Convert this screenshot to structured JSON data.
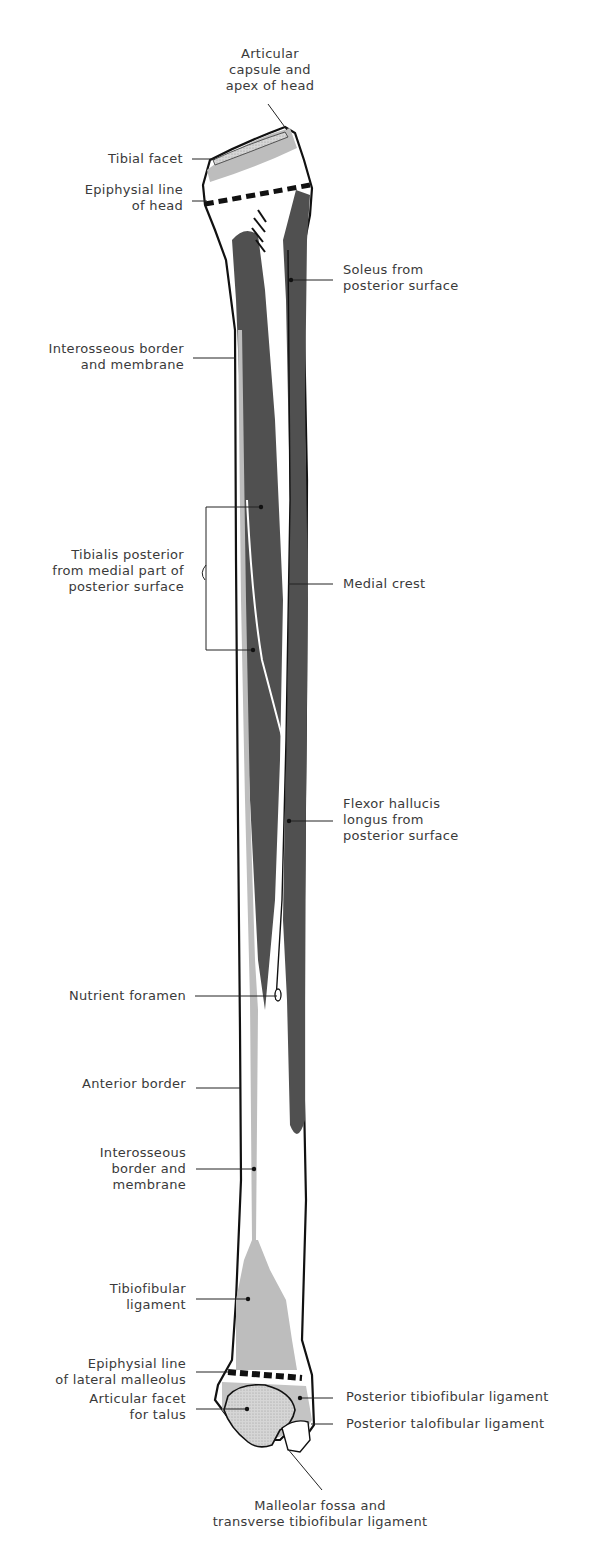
{
  "figure": {
    "colors": {
      "background": "#ffffff",
      "bone_fill": "#ffffff",
      "outline": "#111111",
      "muscle_origin_dark": "#505050",
      "ligament_light": "#bdbdbd",
      "label_text": "#3a3a3a",
      "leader_line": "#222222"
    }
  },
  "labels": {
    "articular_capsule": "Articular\ncapsule and\napex of head",
    "tibial_facet": "Tibial facet",
    "epiphysial_head": "Epiphysial line\nof head",
    "soleus": "Soleus from\nposterior surface",
    "interosseous_upper": "Interosseous border\nand membrane",
    "tibialis_posterior": "Tibialis posterior\nfrom medial part of\nposterior surface",
    "medial_crest": "Medial crest",
    "flexor_hallucis": "Flexor hallucis\nlongus from\nposterior surface",
    "nutrient_foramen": "Nutrient foramen",
    "anterior_border": "Anterior border",
    "interosseous_lower": "Interosseous\nborder and\nmembrane",
    "tibiofibular_ligament": "Tibiofibular\nligament",
    "epiphysial_malleolus": "Epiphysial line\nof lateral malleolus",
    "articular_facet_talus": "Articular facet\nfor talus",
    "posterior_tibiofibular": "Posterior tibiofibular ligament",
    "posterior_talofibular": "Posterior talofibular ligament",
    "malleolar_fossa": "Malleolar fossa and\ntransverse tibiofibular ligament"
  }
}
